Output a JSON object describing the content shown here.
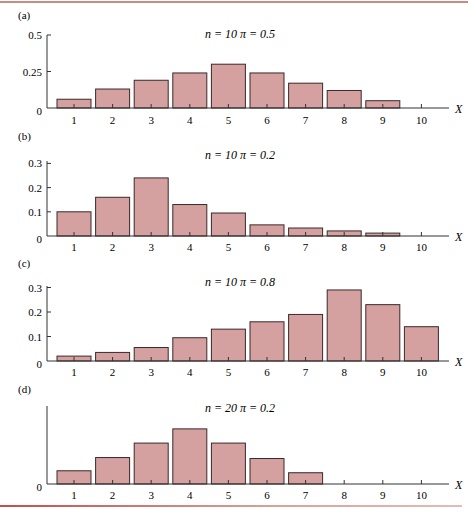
{
  "colors": {
    "bar_fill": "#d4a0a0",
    "bar_stroke": "#3a2a2a",
    "axis": "#333333",
    "rule": "#c98b84"
  },
  "chart_data": [
    {
      "type": "bar",
      "panel": "(a)",
      "title": "n = 10    π = 0.5",
      "params": {
        "n": 10,
        "pi": 0.5
      },
      "xlabel": "X",
      "ylabel": "",
      "categories": [
        1,
        2,
        3,
        4,
        5,
        6,
        7,
        8,
        9,
        10
      ],
      "values": [
        0.06,
        0.13,
        0.19,
        0.24,
        0.3,
        0.24,
        0.17,
        0.12,
        0.05,
        0
      ],
      "yticks": [
        0,
        0.25,
        0.5
      ],
      "ytick_labels": [
        "0",
        "0.25",
        "0.5"
      ],
      "ylim": [
        0,
        0.5
      ],
      "grid": false
    },
    {
      "type": "bar",
      "panel": "(b)",
      "title": "n = 10    π = 0.2",
      "params": {
        "n": 10,
        "pi": 0.2
      },
      "xlabel": "X",
      "ylabel": "",
      "categories": [
        1,
        2,
        3,
        4,
        5,
        6,
        7,
        8,
        9,
        10
      ],
      "values": [
        0.1,
        0.16,
        0.24,
        0.13,
        0.095,
        0.046,
        0.033,
        0.021,
        0.012,
        0
      ],
      "yticks": [
        0,
        0.1,
        0.2,
        0.3
      ],
      "ytick_labels": [
        "0",
        "0.1",
        "0.2",
        "0.3"
      ],
      "ylim": [
        0,
        0.3
      ],
      "grid": false
    },
    {
      "type": "bar",
      "panel": "(c)",
      "title": "n = 10    π = 0.8",
      "params": {
        "n": 10,
        "pi": 0.8
      },
      "xlabel": "X",
      "ylabel": "",
      "categories": [
        1,
        2,
        3,
        4,
        5,
        6,
        7,
        8,
        9,
        10
      ],
      "values": [
        0.02,
        0.035,
        0.055,
        0.095,
        0.13,
        0.16,
        0.19,
        0.29,
        0.23,
        0.14
      ],
      "yticks": [
        0,
        0.1,
        0.2,
        0.3
      ],
      "ytick_labels": [
        "0",
        "0.1",
        "0.2",
        "0.3"
      ],
      "ylim": [
        0,
        0.3
      ],
      "grid": false
    },
    {
      "type": "bar",
      "panel": "(d)",
      "title": "n = 20    π = 0.2",
      "params": {
        "n": 20,
        "pi": 0.2
      },
      "xlabel": "X",
      "ylabel": "",
      "categories": [
        1,
        2,
        3,
        4,
        5,
        6,
        7,
        8,
        9,
        10
      ],
      "values": [
        0.054,
        0.108,
        0.167,
        0.225,
        0.167,
        0.104,
        0.046,
        0,
        0,
        0
      ],
      "yticks": [
        0
      ],
      "ytick_labels": [
        "0"
      ],
      "ylim": [
        0,
        0.32
      ],
      "grid": false
    }
  ],
  "layout": {
    "panels": [
      {
        "label_y": 19,
        "title_y": 38,
        "axis_top": 35,
        "baseline": 108,
        "px_per_unit": 146,
        "xlabel_y": 124
      },
      {
        "label_y": 140,
        "title_y": 159,
        "axis_top": 161,
        "baseline": 236,
        "px_per_unit": 242,
        "xlabel_y": 251
      },
      {
        "label_y": 267,
        "title_y": 286,
        "axis_top": 286,
        "baseline": 361,
        "px_per_unit": 245,
        "xlabel_y": 376
      },
      {
        "label_y": 393,
        "title_y": 412,
        "axis_top": 406,
        "baseline": 484,
        "px_per_unit": 245,
        "xlabel_y": 499
      }
    ],
    "axis_x": 47,
    "first_tick_x": 74,
    "tick_step": 38.6,
    "bar_width": 34,
    "axis_end_x": 449,
    "xlabel_x": 455,
    "title_x": 240
  }
}
